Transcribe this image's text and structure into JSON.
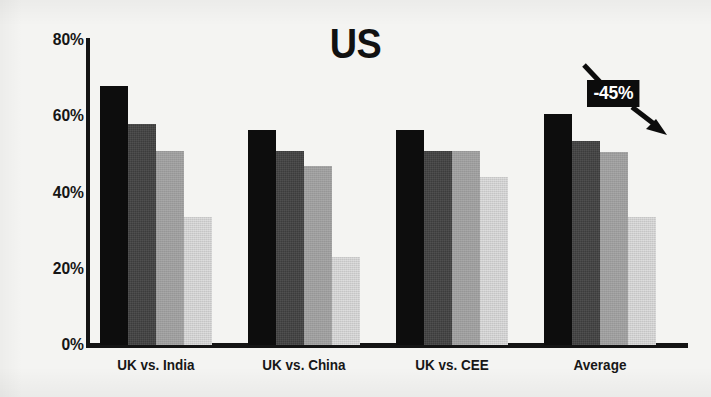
{
  "chart_data": {
    "type": "bar",
    "title": "US",
    "xlabel": "",
    "ylabel": "",
    "ylim": [
      0,
      80
    ],
    "grid": false,
    "legend": "none",
    "y_ticks": [
      "0%",
      "20%",
      "40%",
      "60%",
      "80%"
    ],
    "y_tick_values": [
      0,
      20,
      40,
      60,
      80
    ],
    "categories": [
      "UK vs. India",
      "UK vs. China",
      "UK vs. CEE",
      "Average"
    ],
    "series": [
      {
        "name": "series-1",
        "color": "#0d0d0d",
        "values": [
          68,
          56.5,
          56.5,
          60.5
        ]
      },
      {
        "name": "series-2",
        "color": "#3c3c3c",
        "values": [
          58,
          51,
          51,
          53.5
        ]
      },
      {
        "name": "series-3",
        "color": "#9d9d9d",
        "values": [
          51,
          47,
          51,
          50.5
        ]
      },
      {
        "name": "series-4",
        "color": "#cfcfcf",
        "values": [
          33.5,
          23,
          44,
          33.5
        ]
      }
    ],
    "annotations": [
      {
        "name": "decline-callout",
        "label": "-45%",
        "text_color": "#ffffff",
        "background_color": "#0c0c0c",
        "arrow": "down-right"
      }
    ]
  },
  "colors": {
    "background": "#f4f4f2",
    "axis": "#141414",
    "text": "#161616",
    "bar_1": "#0d0d0d",
    "bar_2": "#3c3c3c",
    "bar_3": "#9d9d9d",
    "bar_4": "#cfcfcf",
    "annotation_bg": "#0c0c0c",
    "annotation_text": "#ffffff"
  }
}
